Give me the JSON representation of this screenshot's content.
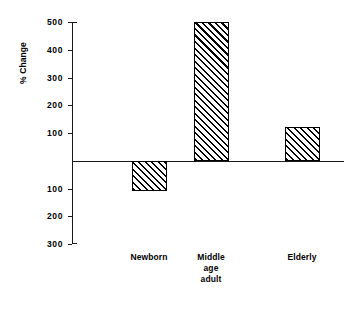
{
  "chart_data": {
    "type": "bar",
    "title": "",
    "subtitle": "",
    "xlabel": "",
    "ylabel": "% Change",
    "categories": [
      "Newborn",
      "Middle\nage\nadult",
      "Elderly"
    ],
    "values": [
      -110,
      500,
      120
    ],
    "ylim": [
      -300,
      500
    ],
    "ytick_values": [
      500,
      400,
      300,
      200,
      100,
      0,
      -100,
      -200,
      -300
    ],
    "ytick_labels": [
      "500",
      "400",
      "300",
      "200",
      "100",
      "",
      "100",
      "200",
      "300"
    ],
    "grid": false,
    "legend": null,
    "series": [
      {
        "name": "% Change",
        "values": [
          -110,
          500,
          120
        ],
        "fill": "diagonal-hatch",
        "edge_color": "#000000",
        "face_color": "#ffffff"
      }
    ]
  },
  "colors": {
    "background": "#ffffff",
    "ink": "#000000",
    "axis": "#1a1a1a"
  }
}
